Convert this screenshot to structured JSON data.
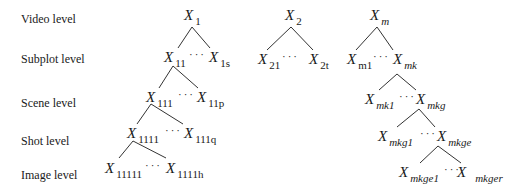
{
  "levels": {
    "video": "Video level",
    "subplot": "Subplot level",
    "scene": "Scene level",
    "shot": "Shot level",
    "image": "Image level"
  },
  "nodes": {
    "x": "X",
    "x1": "1",
    "x11": "11",
    "x1s": "1s",
    "x111": "111",
    "x11p": "11p",
    "x1111": "1111",
    "x111q": "111q",
    "x11111": "11111",
    "x1111h": "1111h",
    "x2": "2",
    "x21": "21",
    "x2t": "2t",
    "xm": "m",
    "xm1": "m1",
    "xmk": "mk",
    "xmk1": "mk1",
    "xmkg": "mkg",
    "xmkg1": "mkg1",
    "xmkge": "mkge",
    "xmkge1": "mkge1",
    "xmkger": "mkger"
  },
  "ellipsis": "···"
}
